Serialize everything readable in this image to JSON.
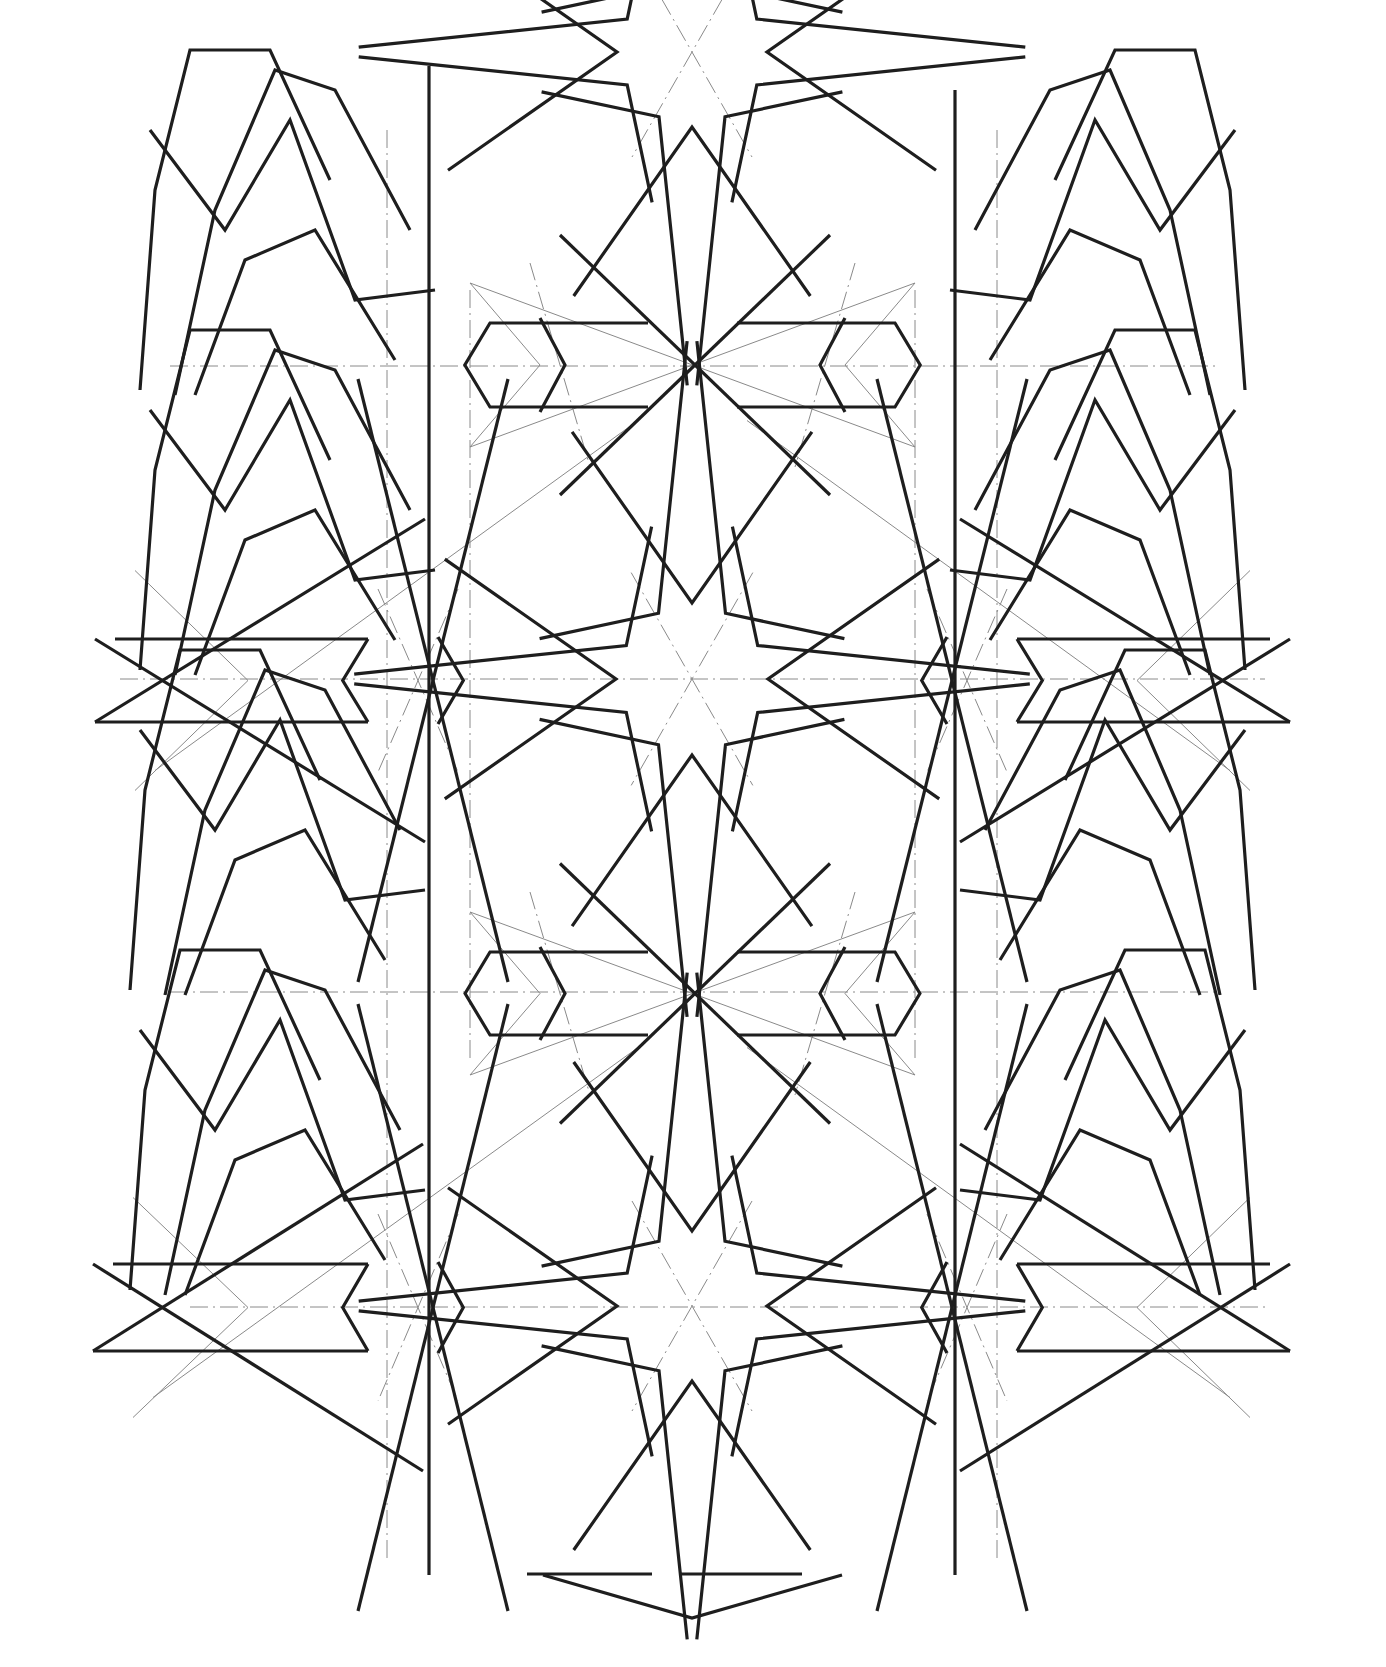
{
  "drawing": {
    "title": "Geometric star pattern construction drawing",
    "background": "#ffffff",
    "ink_color": "#1e1e1e",
    "construction_color": "#8a8a8a",
    "rosettes": [
      {
        "name": "center-rosette",
        "cx": 692,
        "cy": 679,
        "r": 76
      },
      {
        "name": "bottom-rosette",
        "cx": 692,
        "cy": 1306,
        "r": 75
      },
      {
        "name": "top-rosette-partial",
        "cx": 692,
        "cy": 52,
        "r": 75
      }
    ],
    "thick_verticals": [
      {
        "x": 429,
        "y1": 66,
        "y2": 1575
      },
      {
        "x": 955,
        "y1": 90,
        "y2": 1575
      }
    ],
    "dashdot_horizontals": [
      {
        "y": 366,
        "x1": 170,
        "x2": 1215
      },
      {
        "y": 679,
        "x1": 120,
        "x2": 1265
      },
      {
        "y": 992,
        "x1": 170,
        "x2": 1215
      },
      {
        "y": 1307,
        "x1": 190,
        "x2": 1265
      }
    ],
    "thin_verticals": [
      {
        "x": 387,
        "y1": 130,
        "y2": 1560
      },
      {
        "x": 470,
        "y1": 290,
        "y2": 1060
      },
      {
        "x": 915,
        "y1": 290,
        "y2": 1060
      },
      {
        "x": 997,
        "y1": 130,
        "y2": 1560
      }
    ],
    "hexagon_bands": [
      {
        "name": "upper-center-band",
        "y_top": 323,
        "y_bot": 407,
        "x_left": 470,
        "x_right": 915
      },
      {
        "name": "lower-center-band",
        "y_top": 952,
        "y_bot": 1035,
        "x_left": 470,
        "x_right": 915
      }
    ],
    "side_bands": [
      {
        "name": "left-middle-band",
        "y_top": 639,
        "y_bot": 722,
        "x_tip": 95,
        "x_hex": 388
      },
      {
        "name": "right-middle-band",
        "y_top": 639,
        "y_bot": 722,
        "x_tip": 1290,
        "x_hex": 997
      },
      {
        "name": "left-bottom-band",
        "y_top": 1264,
        "y_bot": 1351,
        "x_tip": 93,
        "x_hex": 388
      },
      {
        "name": "right-bottom-band",
        "y_top": 1264,
        "y_bot": 1351,
        "x_tip": 1290,
        "x_hex": 997
      }
    ]
  }
}
